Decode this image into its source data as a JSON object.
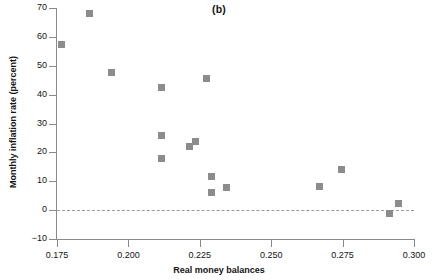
{
  "figure": {
    "title": "(b)",
    "marker_color": "#8c8c8c",
    "axis_color": "#8a8a8a",
    "zero_line_color": "#9b9b9b"
  },
  "chart_data": {
    "type": "scatter",
    "title": "(b)",
    "xlabel": "Real money balances",
    "ylabel": "Monthly inflation rate (percent)",
    "xlim": [
      0.175,
      0.3
    ],
    "ylim": [
      -10,
      70
    ],
    "xticks": [
      0.175,
      0.2,
      0.225,
      0.25,
      0.275,
      0.3
    ],
    "xtick_labels": [
      "0.175",
      "0.200",
      "0.225",
      "0.250",
      "0.275",
      "0.300"
    ],
    "yticks": [
      -10,
      0,
      10,
      20,
      30,
      40,
      50,
      60,
      70
    ],
    "ytick_labels": [
      "-10",
      "0",
      "10",
      "20",
      "30",
      "40",
      "50",
      "60",
      "70"
    ],
    "grid": false,
    "legend": null,
    "reference_lines": [
      {
        "axis": "y",
        "value": 0,
        "style": "dashed"
      }
    ],
    "marker": "square",
    "points": [
      {
        "x": 0.1765,
        "y": 57.5
      },
      {
        "x": 0.1865,
        "y": 68.0
      },
      {
        "x": 0.194,
        "y": 47.8
      },
      {
        "x": 0.2115,
        "y": 42.5
      },
      {
        "x": 0.2275,
        "y": 45.6
      },
      {
        "x": 0.2115,
        "y": 26.0
      },
      {
        "x": 0.2215,
        "y": 22.2
      },
      {
        "x": 0.2235,
        "y": 23.6
      },
      {
        "x": 0.2115,
        "y": 18.0
      },
      {
        "x": 0.229,
        "y": 11.7
      },
      {
        "x": 0.2345,
        "y": 8.0
      },
      {
        "x": 0.229,
        "y": 6.0
      },
      {
        "x": 0.267,
        "y": 8.3
      },
      {
        "x": 0.2745,
        "y": 14.2
      },
      {
        "x": 0.2915,
        "y": -1.0
      },
      {
        "x": 0.2945,
        "y": 2.2
      }
    ]
  }
}
